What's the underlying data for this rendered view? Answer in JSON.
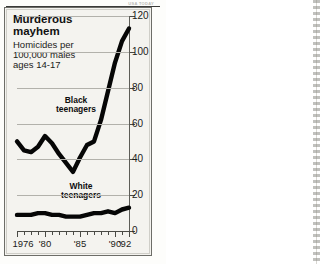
{
  "source_tag": "USA TODAY",
  "title": "Murderous mayhem",
  "subtitle": "Homicides per 100,000 males ages 14-17",
  "labels": {
    "black": "Black teenagers",
    "white": "White teenagers"
  },
  "chart_data": {
    "type": "line",
    "title": "Murderous mayhem",
    "subtitle": "Homicides per 100,000 males ages 14-17",
    "xlabel": "",
    "ylabel": "Homicides per 100,000 males ages 14-17",
    "xlim": [
      1976,
      1992
    ],
    "ylim": [
      0,
      120
    ],
    "yticks": [
      0,
      20,
      40,
      60,
      80,
      100,
      120
    ],
    "ytick_labels": [
      "0",
      "20",
      "40",
      "60",
      "80",
      "100",
      "120"
    ],
    "xticks": [
      1976,
      1977,
      1978,
      1979,
      1980,
      1981,
      1982,
      1983,
      1984,
      1985,
      1986,
      1987,
      1988,
      1989,
      1990,
      1991,
      1992
    ],
    "xtick_labels": [
      "1976",
      "'80",
      "'85",
      "'90",
      "'92"
    ],
    "xtick_label_years": [
      1976,
      1980,
      1985,
      1990,
      1992
    ],
    "grid": true,
    "legend": "inline-annotations",
    "x": [
      1976,
      1977,
      1978,
      1979,
      1980,
      1981,
      1982,
      1983,
      1984,
      1985,
      1986,
      1987,
      1988,
      1989,
      1990,
      1991,
      1992
    ],
    "series": [
      {
        "name": "Black teenagers",
        "color": "#060606",
        "values": [
          50,
          45,
          44,
          47,
          53,
          49,
          43,
          38,
          33,
          41,
          48,
          50,
          62,
          78,
          94,
          106,
          113
        ]
      },
      {
        "name": "White teenagers",
        "color": "#060606",
        "values": [
          9,
          9,
          9,
          10,
          10,
          9,
          9,
          8,
          8,
          8,
          9,
          10,
          10,
          11,
          10,
          12,
          13
        ]
      }
    ]
  }
}
